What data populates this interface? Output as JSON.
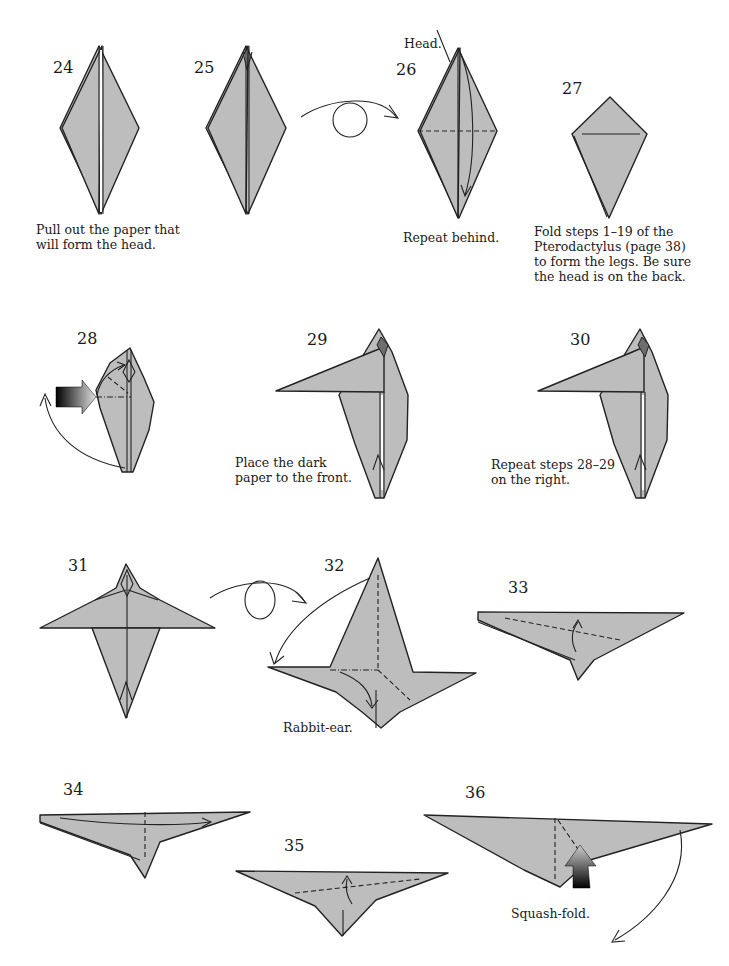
{
  "page": {
    "paper_color": "#bdbdbd",
    "dark_paper_color": "#6e6e6e"
  },
  "steps": [
    {
      "number": "24",
      "caption": [
        "Pull out the paper that",
        "will form the head."
      ]
    },
    {
      "number": "25",
      "caption": []
    },
    {
      "number": "26",
      "label": "Head.",
      "caption": [
        "Repeat behind."
      ]
    },
    {
      "number": "27",
      "caption": [
        "Fold steps 1–19 of the",
        "Pterodactylus (page 38)",
        "to form the legs. Be sure",
        "the head is on the back."
      ]
    },
    {
      "number": "28",
      "caption": []
    },
    {
      "number": "29",
      "caption": [
        "Place the dark",
        "paper to the front."
      ]
    },
    {
      "number": "30",
      "caption": [
        "Repeat steps 28–29",
        "on the right."
      ]
    },
    {
      "number": "31",
      "caption": []
    },
    {
      "number": "32",
      "caption": [
        "Rabbit-ear."
      ]
    },
    {
      "number": "33",
      "caption": []
    },
    {
      "number": "34",
      "caption": []
    },
    {
      "number": "35",
      "caption": []
    },
    {
      "number": "36",
      "caption": [
        "Squash-fold."
      ]
    }
  ],
  "symbols": {
    "turn_over_1": "turn-over-arrow between steps 25 and 26",
    "turn_over_2": "turn-over-arrow between steps 31 and 32",
    "push_arrow_28": "push-arrow",
    "push_arrow_36": "push-arrow"
  }
}
